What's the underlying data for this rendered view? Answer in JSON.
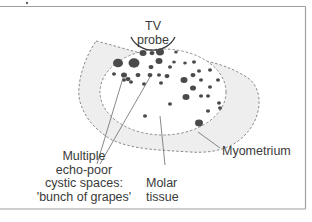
{
  "diagram": {
    "type": "anatomical-ultrasound-schematic",
    "colors": {
      "frame": "#9a9a9a",
      "myometrium_fill": "#eeeeee",
      "dashed_outline": "#8a8a8a",
      "cyst_fill": "#4a4a4a",
      "leader_line": "#6a6a6a",
      "text": "#3a3a3a"
    },
    "labels": {
      "probe": [
        "TV",
        "probe"
      ],
      "cysts": [
        "Multiple",
        "echo-poor",
        "cystic spaces:",
        "'bunch of grapes'"
      ],
      "molar": [
        "Molar",
        "tissue"
      ],
      "myometrium": "Myometrium"
    },
    "cysts": [
      [
        143,
        53,
        3.5
      ],
      [
        152,
        53,
        2.5
      ],
      [
        160,
        52,
        4
      ],
      [
        176,
        52,
        1.8
      ],
      [
        118,
        63,
        5
      ],
      [
        134,
        63,
        5.5
      ],
      [
        159,
        61,
        3.5
      ],
      [
        174,
        62,
        1.8
      ],
      [
        185,
        63,
        1.8
      ],
      [
        194,
        62,
        2
      ],
      [
        151,
        67,
        2.5
      ],
      [
        170,
        67,
        2
      ],
      [
        199,
        71,
        2
      ],
      [
        210,
        70,
        2
      ],
      [
        114,
        74,
        2
      ],
      [
        124,
        75,
        3
      ],
      [
        138,
        75,
        2.5
      ],
      [
        150,
        75,
        2.5
      ],
      [
        159,
        75,
        2
      ],
      [
        167,
        76,
        2.5
      ],
      [
        193,
        75,
        2.5
      ],
      [
        124,
        80,
        2
      ],
      [
        128,
        79,
        2.5
      ],
      [
        131,
        82,
        2
      ],
      [
        184,
        80,
        3.5
      ],
      [
        201,
        80,
        2
      ],
      [
        218,
        80,
        2
      ],
      [
        144,
        84,
        2
      ],
      [
        161,
        83,
        2
      ],
      [
        193,
        88,
        3
      ],
      [
        210,
        87,
        2
      ],
      [
        186,
        97,
        3.5
      ],
      [
        201,
        96,
        2
      ],
      [
        208,
        96,
        2
      ],
      [
        219,
        103,
        2
      ],
      [
        170,
        104,
        2
      ],
      [
        220,
        108,
        2
      ],
      [
        208,
        111,
        2
      ],
      [
        145,
        116,
        2
      ],
      [
        199,
        123,
        4
      ]
    ]
  }
}
